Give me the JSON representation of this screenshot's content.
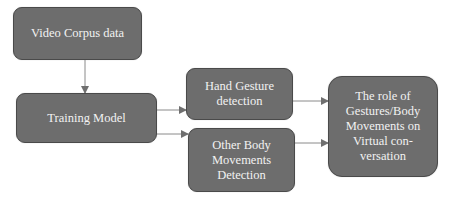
{
  "diagram": {
    "type": "flowchart",
    "colors": {
      "node_fill": "#6d6d6d",
      "node_border": "#4a4a4a",
      "node_text": "#f2f2f2",
      "edge": "#8a8a8a",
      "background": "#ffffff"
    },
    "nodes": [
      {
        "id": "video-corpus",
        "label": "Video Corpus data"
      },
      {
        "id": "training-model",
        "label": "Training Model"
      },
      {
        "id": "hand-gesture",
        "label": "Hand Gesture detection"
      },
      {
        "id": "other-body",
        "label": "Other Body Movements Detection"
      },
      {
        "id": "role",
        "label": "The role of Gestures/Body Movements on Virtual con-versation"
      }
    ],
    "node_lines": {
      "video_corpus": [
        "Video Corpus data"
      ],
      "training_model": [
        "Training Model"
      ],
      "hand_gesture": [
        "Hand Gesture",
        "detection"
      ],
      "other_body": [
        "Other Body",
        "Movements",
        "Detection"
      ],
      "role": [
        "The role of",
        "Gestures/Body",
        "Movements on",
        "Virtual con-",
        "versation"
      ]
    },
    "edges": [
      {
        "from": "video-corpus",
        "to": "training-model"
      },
      {
        "from": "training-model",
        "to": "hand-gesture"
      },
      {
        "from": "training-model",
        "to": "other-body"
      },
      {
        "from": "hand-gesture",
        "to": "role"
      },
      {
        "from": "other-body",
        "to": "role"
      }
    ]
  }
}
